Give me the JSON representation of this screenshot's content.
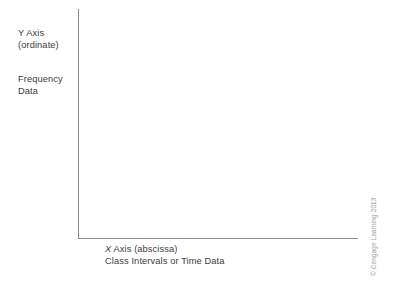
{
  "figure": {
    "kind": "blank-graph-axes-diagram",
    "background_color": "#ffffff",
    "axis_color": "#8a8a8d",
    "text_color": "#3c3c3c",
    "credit_color": "#9a9a9d"
  },
  "y_axis": {
    "name_label": "Y Axis\n(ordinate)",
    "name_line1": "Y Axis",
    "name_line2": "(ordinate)",
    "data_label": "Frequency\nData",
    "data_line1": "Frequency",
    "data_line2": "Data"
  },
  "x_axis": {
    "axis_letter": "X",
    "name_rest": " Axis (abscissa)",
    "name_line": "X Axis (abscissa)",
    "data_line": "Class Intervals or Time Data"
  },
  "credit": {
    "text": "© Cengage Learning 2013"
  },
  "chart_data": {
    "type": "line",
    "title": "",
    "subtitle": "",
    "xlabel": "X Axis (abscissa) — Class Intervals or Time Data",
    "ylabel": "Y Axis (ordinate) — Frequency Data",
    "series": [],
    "categories": [],
    "values": [],
    "x": [],
    "xlim": null,
    "ylim": null,
    "xticks": [],
    "yticks": [],
    "xticklabels": [],
    "yticklabels": [],
    "grid": false,
    "legend": false,
    "legend_position": "none",
    "annotations": [
      "Y Axis (ordinate)",
      "Frequency Data",
      "X Axis (abscissa)",
      "Class Intervals or Time Data"
    ],
    "note": "Empty coordinate frame: only the L-shaped axis lines are drawn, with no data plotted, no tick marks and no tick labels."
  }
}
